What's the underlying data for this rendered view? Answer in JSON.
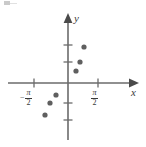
{
  "figure": {
    "title": "",
    "axes": {
      "x_label": "x",
      "y_label": "y",
      "origin_px": {
        "x": 68,
        "y": 83
      },
      "axis_color": "#6b6b6b",
      "axis_line_width": 1.6
    },
    "tick_labels": {
      "negative_half_pi": {
        "minus": "−",
        "numerator": "π",
        "denominator": "2",
        "text": "−π/2",
        "x_px": 34
      },
      "positive_half_pi": {
        "minus": "",
        "numerator": "π",
        "denominator": "2",
        "text": "π/2",
        "x_px": 98
      }
    },
    "x_ticks_px": [
      34,
      98
    ],
    "y_ticks_px": [
      45,
      62,
      103,
      120
    ],
    "point_color": "#5f5f5f",
    "point_radius_px": 2.6
  },
  "chart_data": {
    "type": "scatter",
    "title": "",
    "xlabel": "x",
    "ylabel": "y",
    "grid": false,
    "legend": null,
    "xtick_labels": [
      "−π/2",
      "π/2"
    ],
    "xtick_values": [
      -1.5708,
      1.5708
    ],
    "ytick_labels": [],
    "xlim": [
      -2.2,
      2.2
    ],
    "ylim": [
      -2.5,
      2.5
    ],
    "points_px": [
      {
        "x": 84,
        "y": 47
      },
      {
        "x": 80,
        "y": 62
      },
      {
        "x": 76,
        "y": 71
      },
      {
        "x": 56,
        "y": 95
      },
      {
        "x": 50,
        "y": 103
      },
      {
        "x": 45,
        "y": 115
      }
    ],
    "points": [
      {
        "x": 0.74,
        "y": 1.75
      },
      {
        "x": 0.55,
        "y": 1.0
      },
      {
        "x": 0.37,
        "y": 0.6
      },
      {
        "x": -0.59,
        "y": -0.6
      },
      {
        "x": -0.88,
        "y": -1.0
      },
      {
        "x": -1.13,
        "y": -1.6
      }
    ]
  }
}
